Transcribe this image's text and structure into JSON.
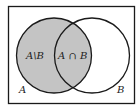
{
  "diagram": {
    "type": "venn",
    "colors": {
      "background": "#ffffff",
      "stroke": "#1a1a1a",
      "shaded": "#c4c4c4"
    },
    "labels": {
      "difference": "A\\B",
      "intersection": "A ∩ B",
      "set_a": "A",
      "set_b": "B"
    },
    "shaded_region": "A"
  }
}
